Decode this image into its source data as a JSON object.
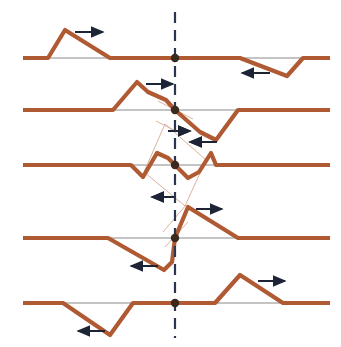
{
  "figure": {
    "width": 341,
    "height": 347,
    "background": "#ffffff",
    "colors": {
      "wave": "#b05a34",
      "wave_light": "#d8a98e",
      "axis": "#8a8a8a",
      "dash": "#2b3550",
      "arrow": "#1d2436",
      "marker": "#3a2a1e"
    },
    "stroke_widths": {
      "wave": 4.2,
      "axis": 1,
      "thin": 0.9,
      "dash": 2.2,
      "arrow": 2
    },
    "marker_radius": 4.2,
    "reference_line": {
      "label": "vertical-dashed-reference",
      "x": 175,
      "y1": 12,
      "y2": 338,
      "dash_pattern": "11 7"
    }
  },
  "chart_data": {
    "type": "line",
    "xlabel": "",
    "ylabel": "",
    "xlim": [
      0,
      341
    ],
    "ylim": [
      347,
      0
    ],
    "grid": false,
    "legend": null,
    "annotations": [
      {
        "name": "reference-axis",
        "type": "dashed-vertical",
        "x": 175
      }
    ],
    "panels": [
      {
        "index": 1,
        "name": "panel-1",
        "baseline_y": 58,
        "x_start": 23,
        "x_end": 330,
        "center_marker": {
          "x": 175,
          "y": 58
        },
        "points": [
          [
            23,
            58
          ],
          [
            48,
            58
          ],
          [
            65,
            30
          ],
          [
            110,
            58
          ],
          [
            240,
            58
          ],
          [
            287,
            76
          ],
          [
            303,
            58
          ],
          [
            330,
            58
          ]
        ],
        "direction_arrows": [
          {
            "name": "arrow-right-crest-1",
            "dir": "right",
            "x1": 75,
            "x2": 103,
            "y": 32
          },
          {
            "name": "arrow-left-trough-1",
            "dir": "left",
            "x1": 270,
            "x2": 242,
            "y": 73
          }
        ],
        "thin_lines": []
      },
      {
        "index": 2,
        "name": "panel-2",
        "baseline_y": 110,
        "x_start": 23,
        "x_end": 330,
        "center_marker": {
          "x": 175,
          "y": 110
        },
        "points": [
          [
            23,
            110
          ],
          [
            113,
            110
          ],
          [
            137,
            82
          ],
          [
            148,
            92
          ],
          [
            166,
            100
          ],
          [
            175,
            110
          ],
          [
            200,
            132
          ],
          [
            216,
            140
          ],
          [
            238,
            110
          ],
          [
            330,
            110
          ]
        ],
        "direction_arrows": [
          {
            "name": "arrow-right-crest-2",
            "dir": "right",
            "x1": 146,
            "x2": 173,
            "y": 84
          },
          {
            "name": "arrow-right-center-2",
            "dir": "right",
            "x1": 168,
            "x2": 190,
            "y": 131
          },
          {
            "name": "arrow-left-trough-2",
            "dir": "left",
            "x1": 217,
            "x2": 190,
            "y": 142
          }
        ],
        "thin_lines": [
          {
            "name": "tangent-upper-2",
            "x1": 158,
            "y1": 101,
            "x2": 193,
            "y2": 119
          },
          {
            "name": "tangent-lower-2",
            "x1": 156,
            "y1": 121,
            "x2": 180,
            "y2": 133
          }
        ]
      },
      {
        "index": 3,
        "name": "panel-3",
        "baseline_y": 165,
        "x_start": 23,
        "x_end": 330,
        "center_marker": {
          "x": 175,
          "y": 165
        },
        "points": [
          [
            23,
            165
          ],
          [
            131,
            165
          ],
          [
            143,
            177
          ],
          [
            157,
            153
          ],
          [
            168,
            158
          ],
          [
            175,
            165
          ],
          [
            188,
            178
          ],
          [
            199,
            172
          ],
          [
            211,
            153
          ],
          [
            216,
            165
          ],
          [
            330,
            165
          ]
        ],
        "direction_arrows": [
          {
            "name": "arrow-right-center-3",
            "dir": "right",
            "x1": 168,
            "x2": 190,
            "y": 131
          },
          {
            "name": "arrow-left-upper-3",
            "dir": "left",
            "x1": 216,
            "x2": 190,
            "y": 142
          },
          {
            "name": "arrow-left-lower-3",
            "dir": "left",
            "x1": 176,
            "x2": 152,
            "y": 197
          }
        ],
        "thin_lines": [
          {
            "name": "parallelogram-edge-a",
            "x1": 144,
            "y1": 172,
            "x2": 165,
            "y2": 124
          },
          {
            "name": "parallelogram-edge-b",
            "x1": 165,
            "y1": 124,
            "x2": 206,
            "y2": 160
          },
          {
            "name": "parallelogram-edge-c",
            "x1": 206,
            "y1": 160,
            "x2": 185,
            "y2": 206
          },
          {
            "name": "parallelogram-edge-d",
            "x1": 185,
            "y1": 206,
            "x2": 144,
            "y2": 172
          }
        ]
      },
      {
        "index": 4,
        "name": "panel-4",
        "baseline_y": 238,
        "x_start": 23,
        "x_end": 330,
        "center_marker": {
          "x": 175,
          "y": 238
        },
        "points": [
          [
            23,
            238
          ],
          [
            108,
            238
          ],
          [
            164,
            270
          ],
          [
            172,
            262
          ],
          [
            175,
            238
          ],
          [
            188,
            207
          ],
          [
            238,
            238
          ],
          [
            330,
            238
          ]
        ],
        "direction_arrows": [
          {
            "name": "arrow-left-lower-4",
            "dir": "left",
            "x1": 176,
            "x2": 152,
            "y": 197
          },
          {
            "name": "arrow-right-crest-4",
            "dir": "right",
            "x1": 196,
            "x2": 222,
            "y": 209
          },
          {
            "name": "arrow-left-trough-4",
            "dir": "left",
            "x1": 158,
            "x2": 131,
            "y": 266
          }
        ],
        "thin_lines": [
          {
            "name": "tangent-upper-4",
            "x1": 163,
            "y1": 232,
            "x2": 186,
            "y2": 205
          },
          {
            "name": "tangent-lower-4",
            "x1": 165,
            "y1": 247,
            "x2": 188,
            "y2": 222
          }
        ]
      },
      {
        "index": 5,
        "name": "panel-5",
        "baseline_y": 303,
        "x_start": 23,
        "x_end": 330,
        "center_marker": {
          "x": 175,
          "y": 303
        },
        "points": [
          [
            23,
            303
          ],
          [
            63,
            303
          ],
          [
            110,
            335
          ],
          [
            133,
            303
          ],
          [
            215,
            303
          ],
          [
            240,
            275
          ],
          [
            283,
            303
          ],
          [
            330,
            303
          ]
        ],
        "direction_arrows": [
          {
            "name": "arrow-left-trough-5",
            "dir": "left",
            "x1": 105,
            "x2": 78,
            "y": 331
          },
          {
            "name": "arrow-right-crest-5",
            "dir": "right",
            "x1": 258,
            "x2": 285,
            "y": 281
          }
        ],
        "thin_lines": []
      }
    ]
  }
}
